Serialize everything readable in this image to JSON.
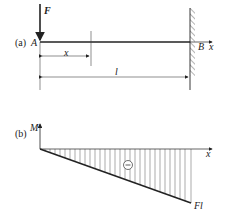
{
  "figure_a": {
    "tag": "(a)",
    "force_label": "F",
    "point_a": "A",
    "point_b": "B",
    "axis_x": "x",
    "dim_x": "x",
    "dim_l": "l"
  },
  "figure_b": {
    "tag": "(b)",
    "axis_m": "M",
    "axis_x": "x",
    "sign": "−",
    "end_value": "Fl"
  },
  "colors": {
    "line": "#222222",
    "hatch": "#555555"
  }
}
